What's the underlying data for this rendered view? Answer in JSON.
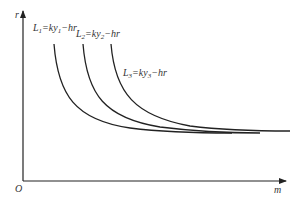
{
  "diagram": {
    "type": "indifference-curves",
    "axes": {
      "origin_label": "O",
      "x_label": "m",
      "y_label": "r"
    },
    "curves": [
      {
        "id": "L1",
        "label_parts": [
          "L",
          "1",
          "=ky",
          "1",
          "−hr"
        ],
        "label": "L1=ky1−hr"
      },
      {
        "id": "L2",
        "label_parts": [
          "L",
          "2",
          "=ky",
          "2",
          "−hr"
        ],
        "label": "L2=ky2−hr"
      },
      {
        "id": "L3",
        "label_parts": [
          "L",
          "3",
          "=ky",
          "3",
          "−hr"
        ],
        "label": "L3=ky3−hr"
      }
    ],
    "colors": {
      "axis": "#222222",
      "curve": "#222222",
      "text": "#333333"
    }
  }
}
